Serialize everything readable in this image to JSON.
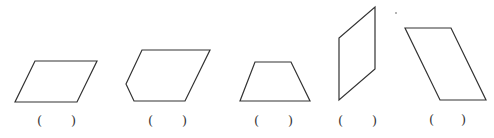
{
  "figure": {
    "stroke_color": "#333333",
    "shapes": [
      {
        "id": "shape-1",
        "kind": "parallelogram",
        "points": "35,61 97,61 77,102 15,102",
        "answer_blank": {
          "open": "(",
          "close": ")",
          "left_x": 37,
          "right_x": 71,
          "y": 114
        }
      },
      {
        "id": "shape-2",
        "kind": "pentagon",
        "points": "142,50 210,50 185,101 134,101 126,84",
        "answer_blank": {
          "open": "(",
          "close": ")",
          "left_x": 148,
          "right_x": 182,
          "y": 114
        }
      },
      {
        "id": "shape-3",
        "kind": "trapezoid",
        "points": "255,62 291,62 310,101 240,101",
        "answer_blank": {
          "open": "(",
          "close": ")",
          "left_x": 254,
          "right_x": 288,
          "y": 114
        }
      },
      {
        "id": "shape-4",
        "kind": "parallelogram",
        "points": "375,7 375,69 339,100 339,38",
        "answer_blank": {
          "open": "(",
          "close": ")",
          "left_x": 338,
          "right_x": 372,
          "y": 114
        }
      },
      {
        "id": "shape-5",
        "kind": "parallelogram",
        "points": "405,28 451,28 486,100 440,100",
        "answer_blank": {
          "open": "(",
          "close": ")",
          "left_x": 429,
          "right_x": 461,
          "y": 113
        }
      }
    ]
  }
}
